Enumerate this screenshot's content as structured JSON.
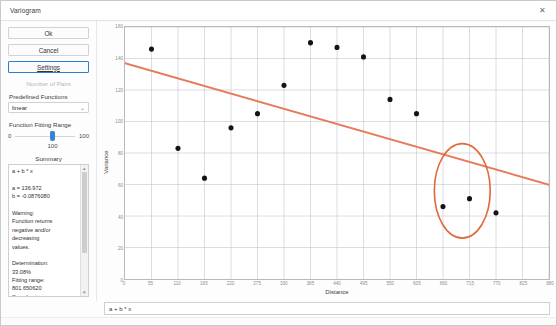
{
  "window": {
    "title": "Variogram",
    "close_icon": "close-icon",
    "close_glyph": "✕"
  },
  "controls": {
    "ok_label": "Ok",
    "cancel_label": "Cancel",
    "settings_label": "Settings",
    "number_of_pairs_label": "Number of Pairs",
    "predefined_functions_label": "Predefined Functions",
    "predefined_functions_value": "linear",
    "predefined_functions_options": [
      "linear",
      "spherical",
      "exponential",
      "gaussian",
      "power"
    ],
    "chevron_glyph": "⌄",
    "fitting_range_label": "Function Fitting Range",
    "fitting_range_min": "0",
    "fitting_range_max": "100",
    "fitting_range_value": "100",
    "summary_label": "Summary",
    "summary_text": "a + b * x\n\na = 136.972\nb = -0.0876080\n\nWarning:\nFunction returns\nnegative and/or\ndecreasing\nvalues.\n\nDetermination:\n33.08%\nFitting range:\n801.650620\nSamples in range:\n14\nLag Classes:",
    "scroll_up_glyph": "▴",
    "scroll_down_glyph": "▾"
  },
  "formula_bar": {
    "value": "a + b * x"
  },
  "chart_data": {
    "type": "scatter",
    "title": "",
    "xlabel": "Distance",
    "ylabel": "Variance",
    "xlim": [
      0,
      880
    ],
    "ylim": [
      0,
      160
    ],
    "grid": true,
    "legend": "none",
    "xticks": [
      0,
      55,
      110,
      165,
      220,
      275,
      330,
      385,
      440,
      495,
      550,
      605,
      660,
      715,
      770,
      825,
      880
    ],
    "xticklabels": [
      "0",
      "55",
      "110",
      "165",
      "220",
      "275",
      "330",
      "385",
      "440",
      "495",
      "550",
      "605",
      "660",
      "715",
      "770",
      "825",
      "880"
    ],
    "yticks": [
      0,
      20,
      40,
      60,
      80,
      100,
      120,
      140,
      160
    ],
    "yticklabels": [
      "0",
      "20",
      "40",
      "60",
      "80",
      "100",
      "120",
      "140",
      "160"
    ],
    "points": [
      {
        "x": 55,
        "y": 146
      },
      {
        "x": 110,
        "y": 83
      },
      {
        "x": 165,
        "y": 64
      },
      {
        "x": 220,
        "y": 96
      },
      {
        "x": 275,
        "y": 105
      },
      {
        "x": 330,
        "y": 123
      },
      {
        "x": 385,
        "y": 150
      },
      {
        "x": 440,
        "y": 147
      },
      {
        "x": 495,
        "y": 141
      },
      {
        "x": 550,
        "y": 114
      },
      {
        "x": 605,
        "y": 105
      },
      {
        "x": 660,
        "y": 46
      },
      {
        "x": 715,
        "y": 51
      },
      {
        "x": 770,
        "y": 42
      }
    ],
    "fit_line": {
      "name": "a + b * x",
      "color": "#e8795a",
      "intercept": 136.972,
      "slope": -0.087608,
      "x_start": 0,
      "x_end": 880
    },
    "annotation_circle": {
      "name": "selection-circle",
      "color": "#e06a3c",
      "center_x": 700,
      "center_y": 56,
      "radius_x": 58,
      "radius_y": 30
    }
  }
}
